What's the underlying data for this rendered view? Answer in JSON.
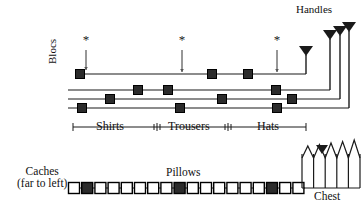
{
  "figure": {
    "width": 364,
    "height": 209,
    "background": "#ffffff",
    "ink": "#1a1a1a",
    "marker_fill": "#2b2b2b"
  },
  "labels": {
    "handles": "Handles",
    "blocs": "Blocs",
    "shirts": "Shirts",
    "trousers": "Trousers",
    "hats": "Hats",
    "caches_line1": "Caches",
    "caches_line2": "(far to left)",
    "pillows": "Pillows",
    "chest": "Chest"
  },
  "chart_data": {
    "type": "diagram",
    "title": "",
    "annotations": [
      "*",
      "*",
      "*"
    ],
    "blocs_panel": {
      "rows": [
        {
          "index": 0,
          "y": 74,
          "x_start": 75,
          "x_end": 306,
          "markers": [
            80,
            212,
            248
          ]
        },
        {
          "index": 1,
          "y": 90,
          "x_start": 68,
          "x_end": 330,
          "markers": [
            138,
            168,
            276
          ]
        },
        {
          "index": 2,
          "y": 99,
          "x_start": 68,
          "x_end": 340,
          "markers": [
            110,
            222,
            292
          ]
        },
        {
          "index": 3,
          "y": 108,
          "x_start": 68,
          "x_end": 349,
          "markers": [
            82,
            180,
            277
          ]
        }
      ],
      "asterisks": [
        {
          "x": 86,
          "y_text": 44,
          "arrow_top": 50,
          "arrow_bottom": 70
        },
        {
          "x": 182,
          "y_text": 44,
          "arrow_top": 50,
          "arrow_bottom": 72
        },
        {
          "x": 277,
          "y_text": 44,
          "arrow_top": 50,
          "arrow_bottom": 72
        }
      ],
      "handles": [
        {
          "x": 306,
          "tip_y": 46,
          "stem_bottom": 74
        },
        {
          "x": 330,
          "tip_y": 30,
          "stem_bottom": 90
        },
        {
          "x": 340,
          "tip_y": 26,
          "stem_bottom": 99
        },
        {
          "x": 349,
          "tip_y": 22,
          "stem_bottom": 108
        }
      ],
      "axis": {
        "y": 127,
        "x_start": 73,
        "x_end": 306,
        "ticks": [
          73,
          157,
          228,
          306
        ],
        "segments": [
          {
            "label": "Shirts",
            "from": 73,
            "to": 157
          },
          {
            "label": "Trousers",
            "from": 157,
            "to": 228
          },
          {
            "label": "Hats",
            "from": 228,
            "to": 306
          }
        ]
      }
    },
    "caches_panel": {
      "baseline_y": 188,
      "x_start": 68,
      "x_end": 305,
      "box_size": 11,
      "box_step": 13.2,
      "box_count": 18,
      "filled_indices": [
        1,
        8,
        15
      ]
    },
    "chest": {
      "base_y": 188,
      "x_start": 302,
      "x_end": 360,
      "peak_count": 5,
      "peak_top_y": 140,
      "valley_y": 158,
      "marker_triangle": {
        "x": 322,
        "y": 145
      }
    }
  }
}
